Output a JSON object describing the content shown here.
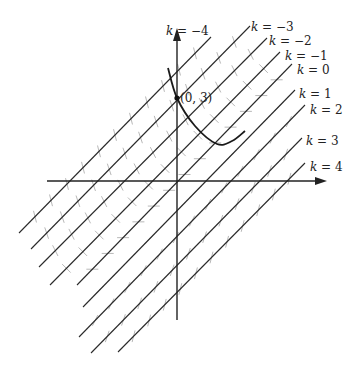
{
  "figure": {
    "point_label": "(0, 3)",
    "isoclines": [
      {
        "k": "-4",
        "label_var": "k",
        "label_eq": " = −4",
        "x0": 68,
        "top": [
          211,
          37
        ],
        "bottom": [
          19,
          233
        ],
        "lx": 166,
        "ly": 31
      },
      {
        "k": "-3",
        "label_var": "k",
        "label_eq": " = −3",
        "x0": 95,
        "top": [
          250,
          26
        ],
        "bottom": [
          31,
          249
        ],
        "lx": 251,
        "ly": 27
      },
      {
        "k": "-2",
        "label_var": "k",
        "label_eq": " = −2",
        "x0": 122,
        "top": [
          267,
          38
        ],
        "bottom": [
          39,
          267
        ],
        "lx": 269,
        "ly": 41
      },
      {
        "k": "-1",
        "label_var": "k",
        "label_eq": " = −1",
        "x0": 150,
        "top": [
          280,
          52
        ],
        "bottom": [
          50,
          285
        ],
        "lx": 285,
        "ly": 56
      },
      {
        "k": "0",
        "label_var": "k",
        "label_eq": " = 0",
        "x0": 177,
        "top": [
          292,
          64
        ],
        "bottom": [
          77,
          285
        ],
        "lx": 297,
        "ly": 70
      },
      {
        "k": "1",
        "label_var": "k",
        "label_eq": " = 1",
        "x0": 204,
        "top": [
          295,
          90
        ],
        "bottom": [
          83,
          307
        ],
        "lx": 299,
        "ly": 94
      },
      {
        "k": "2",
        "label_var": "k",
        "label_eq": " = 2",
        "x0": 232,
        "top": [
          305,
          105
        ],
        "bottom": [
          79,
          337
        ],
        "lx": 310,
        "ly": 110
      },
      {
        "k": "3",
        "label_var": "k",
        "label_eq": " = 3",
        "x0": 259,
        "top": [
          302,
          138
        ],
        "bottom": [
          91,
          353
        ],
        "lx": 306,
        "ly": 141
      },
      {
        "k": "4",
        "label_var": "k",
        "label_eq": " = 4",
        "x0": 286,
        "top": [
          305,
          163
        ],
        "bottom": [
          118,
          352
        ],
        "lx": 310,
        "ly": 167
      }
    ],
    "axes": {
      "origin": [
        177,
        181
      ],
      "x_axis": {
        "from": [
          47,
          181
        ],
        "to": [
          327,
          181
        ]
      },
      "y_axis": {
        "from": [
          177,
          320
        ],
        "to": [
          177,
          28
        ]
      }
    },
    "solution_curve": {
      "points": [
        [
          168,
          68
        ],
        [
          177,
          98
        ],
        [
          195,
          126
        ],
        [
          217,
          144
        ],
        [
          232,
          141
        ],
        [
          245,
          131
        ]
      ]
    },
    "colors": {
      "line": "#2a2a2a",
      "tick": "#b8b8b8",
      "curve": "#1a1a1a"
    }
  }
}
